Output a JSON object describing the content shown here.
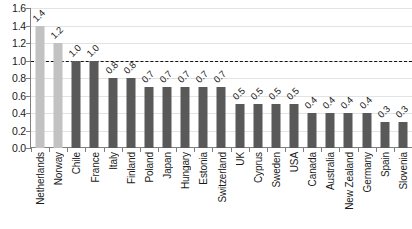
{
  "chart_data": {
    "type": "bar",
    "title": "",
    "xlabel": "",
    "ylabel": "",
    "ylim": [
      0.0,
      1.6
    ],
    "grid": true,
    "legend": false,
    "orientation": "vertical",
    "categories": [
      "Netherlands",
      "Norway",
      "Chile",
      "France",
      "Italy",
      "Finland",
      "Poland",
      "Japan",
      "Hungary",
      "Estonia",
      "Switzerland",
      "UK",
      "Cyprus",
      "Sweden",
      "USA",
      "Canada",
      "Australia",
      "New Zealand",
      "Germany",
      "Spain",
      "Slovenia"
    ],
    "values": [
      1.4,
      1.2,
      1.0,
      1.0,
      0.8,
      0.8,
      0.7,
      0.7,
      0.7,
      0.7,
      0.7,
      0.5,
      0.5,
      0.5,
      0.5,
      0.4,
      0.4,
      0.4,
      0.4,
      0.3,
      0.3
    ],
    "data_labels": [
      "1.4",
      "1.2",
      "1.0",
      "1.0",
      "0.8",
      "0.8",
      "0.7",
      "0.7",
      "0.7",
      "0.7",
      "0.7",
      "0.5",
      "0.5",
      "0.5",
      "0.5",
      "0.4",
      "0.4",
      "0.4",
      "0.4",
      "0.3",
      "0.3"
    ],
    "bar_styles": [
      "light",
      "light",
      "dark",
      "dark",
      "dark",
      "dark",
      "dark",
      "dark",
      "dark",
      "dark",
      "dark",
      "dark",
      "dark",
      "dark",
      "dark",
      "dark",
      "dark",
      "dark",
      "dark",
      "dark",
      "dark"
    ],
    "yticks": [
      0.0,
      0.2,
      0.4,
      0.6,
      0.8,
      1.0,
      1.2,
      1.4,
      1.6
    ],
    "ytick_labels": [
      "0.0",
      "0.2",
      "0.4",
      "0.6",
      "0.8",
      "1.0",
      "1.2",
      "1.4",
      "1.6"
    ],
    "reference_line": {
      "value": 1.0,
      "style": "dashed",
      "color": "#111111"
    },
    "colors": {
      "bar_light": "#c2c2c2",
      "bar_dark": "#595959",
      "gridline": "#e3e3e3",
      "axis": "#808080",
      "text": "#1a1a1a"
    }
  }
}
